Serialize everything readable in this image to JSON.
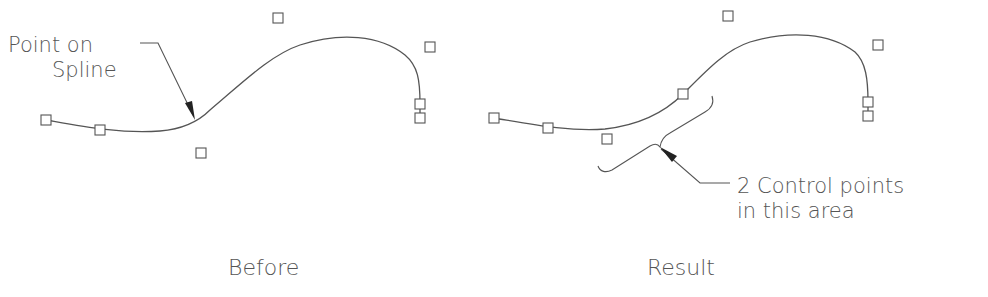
{
  "before": {
    "caption": "Before",
    "callout_line1": "Point on",
    "callout_line2": "Spline",
    "control_points": [
      [
        46,
        120
      ],
      [
        100,
        130
      ],
      [
        201,
        153
      ],
      [
        278,
        18
      ],
      [
        430,
        47
      ],
      [
        420,
        104
      ],
      [
        420,
        118
      ]
    ]
  },
  "result": {
    "caption": "Result",
    "callout_line1": "2 Control points",
    "callout_line2": "in this area",
    "control_points": [
      [
        494,
        118
      ],
      [
        548,
        128
      ],
      [
        607,
        139
      ],
      [
        683,
        94
      ],
      [
        728,
        16
      ],
      [
        878,
        45
      ],
      [
        868,
        102
      ],
      [
        868,
        116
      ]
    ]
  },
  "colors": {
    "line": "#555555",
    "background": "#ffffff"
  }
}
